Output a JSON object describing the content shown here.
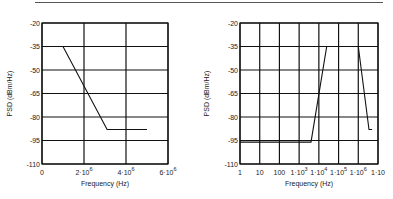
{
  "chart_data": [
    {
      "type": "line",
      "title": "",
      "xlabel": "Frequency (Hz)",
      "ylabel": "PSD (dBm/Hz)",
      "xscale": "linear",
      "xlim": [
        0,
        6000000
      ],
      "ylim": [
        -110,
        -20
      ],
      "grid": true,
      "x_ticks": [
        {
          "value": 0,
          "base": "0",
          "exp": ""
        },
        {
          "value": 2000000,
          "base": "2·10",
          "exp": "6"
        },
        {
          "value": 4000000,
          "base": "4·10",
          "exp": "6"
        },
        {
          "value": 6000000,
          "base": "6·10",
          "exp": "6"
        }
      ],
      "y_ticks": [
        -20,
        -35,
        -50,
        -65,
        -80,
        -95,
        -110
      ],
      "series": [
        {
          "name": "PSD mask",
          "x": [
            0,
            1000000,
            3100000,
            5000000
          ],
          "y": [
            -35,
            -35,
            -88,
            -88
          ]
        }
      ]
    },
    {
      "type": "line",
      "title": "",
      "xlabel": "Frequency (Hz)",
      "ylabel": "PSD (dBm/Hz)",
      "xscale": "log",
      "xlim": [
        1,
        10000000
      ],
      "ylim": [
        -110,
        -20
      ],
      "grid": true,
      "x_ticks": [
        {
          "value": 1,
          "base": "1",
          "exp": ""
        },
        {
          "value": 10,
          "base": "10",
          "exp": ""
        },
        {
          "value": 100,
          "base": "100",
          "exp": ""
        },
        {
          "value": 1000,
          "base": "1·10",
          "exp": "3"
        },
        {
          "value": 10000,
          "base": "1·10",
          "exp": "4"
        },
        {
          "value": 100000,
          "base": "1·10",
          "exp": "5"
        },
        {
          "value": 1000000,
          "base": "1·10",
          "exp": "6"
        },
        {
          "value": 10000000,
          "base": "1·10",
          "exp": ""
        }
      ],
      "y_ticks": [
        -20,
        -35,
        -50,
        -65,
        -80,
        -95,
        -110
      ],
      "series": [
        {
          "name": "PSD mask",
          "x": [
            1,
            4000,
            25000,
            1000000,
            3500000,
            5000000
          ],
          "y": [
            -96,
            -96,
            -35,
            -35,
            -88,
            -88
          ]
        }
      ]
    }
  ]
}
